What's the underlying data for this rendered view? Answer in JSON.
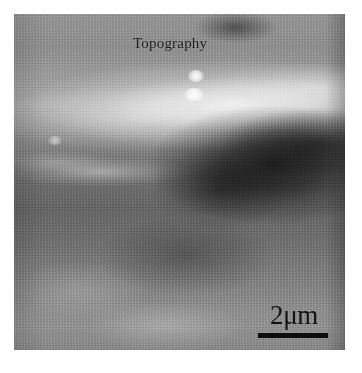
{
  "figure": {
    "type": "scanning-probe-micrograph",
    "title_overlay": "Topography",
    "scalebar": {
      "label": "2μm",
      "value": 2,
      "unit": "μm",
      "bar_length_px": 70,
      "position": "bottom-right"
    },
    "colors": {
      "background": "#ffffff",
      "image_mid_tone": "#8a8a8a",
      "annotation_text": "#1c1c1c",
      "scalebar_bar": "#0d0d0d",
      "border": "#2b2b2b"
    },
    "features": {
      "bright_ridge_band": "diagonal light band across upper third",
      "dark_rough_patch": "high-contrast dark textured region right of centre",
      "bright_particles": 3,
      "left_streak": "faint light streak at mid-left"
    }
  }
}
